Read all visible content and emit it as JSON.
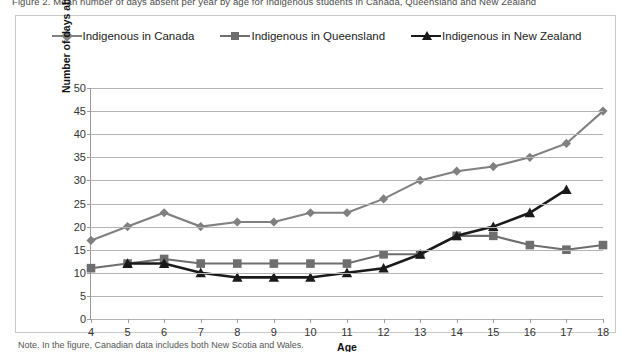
{
  "figure": {
    "top_clipped_text": "Figure 2. Mean number of days absent per year by age for Indigenous students in Canada, Queensland and New Zealand",
    "note": "Note. In the figure, Canadian data includes both New Scotia and Wales."
  },
  "legend": {
    "position": "top-center",
    "entries": [
      {
        "label": "Indigenous in Canada",
        "marker": "diamond",
        "color": "#808080"
      },
      {
        "label": "Indigenous in Queensland",
        "marker": "square",
        "color": "#6e6e6e"
      },
      {
        "label": "Indigenous in New Zealand",
        "marker": "triangle",
        "color": "#1a1a1a"
      }
    ]
  },
  "chart_data": {
    "type": "line",
    "title": "",
    "subtitle": "",
    "xlabel": "Age",
    "ylabel": "Number of days absent per year",
    "x": [
      4,
      5,
      6,
      7,
      8,
      9,
      10,
      11,
      12,
      13,
      14,
      15,
      16,
      17,
      18
    ],
    "categories": [
      "4",
      "5",
      "6",
      "7",
      "8",
      "9",
      "10",
      "11",
      "12",
      "13",
      "14",
      "15",
      "16",
      "17",
      "18"
    ],
    "xlim": [
      4,
      18
    ],
    "ylim": [
      0,
      50
    ],
    "yticks": [
      0,
      5,
      10,
      15,
      20,
      25,
      30,
      35,
      40,
      45,
      50
    ],
    "xticks": [
      4,
      5,
      6,
      7,
      8,
      9,
      10,
      11,
      12,
      13,
      14,
      15,
      16,
      17,
      18
    ],
    "grid": true,
    "grid_axis": "y",
    "series": [
      {
        "name": "Indigenous in Canada",
        "marker": "diamond",
        "color": "#808080",
        "x": [
          4,
          5,
          6,
          7,
          8,
          9,
          10,
          11,
          12,
          13,
          14,
          15,
          16,
          17,
          18
        ],
        "values": [
          17,
          20,
          23,
          20,
          21,
          21,
          23,
          23,
          26,
          30,
          32,
          33,
          35,
          38,
          45
        ]
      },
      {
        "name": "Indigenous in Queensland",
        "marker": "square",
        "color": "#6e6e6e",
        "x": [
          4,
          5,
          6,
          7,
          8,
          9,
          10,
          11,
          12,
          13,
          14,
          15,
          16,
          17,
          18
        ],
        "values": [
          11,
          12,
          13,
          12,
          12,
          12,
          12,
          12,
          14,
          14,
          18,
          18,
          16,
          15,
          16
        ]
      },
      {
        "name": "Indigenous in New Zealand",
        "marker": "triangle",
        "color": "#1a1a1a",
        "x": [
          5,
          6,
          7,
          8,
          9,
          10,
          11,
          12,
          13,
          14,
          15,
          16,
          17
        ],
        "values": [
          12,
          12,
          10,
          9,
          9,
          9,
          10,
          11,
          14,
          18,
          20,
          23,
          28
        ]
      }
    ]
  },
  "colors": {
    "frame": "#c9c9c9",
    "axis": "#9b9b9b",
    "grid": "#b4b4b4",
    "text": "#333333"
  }
}
